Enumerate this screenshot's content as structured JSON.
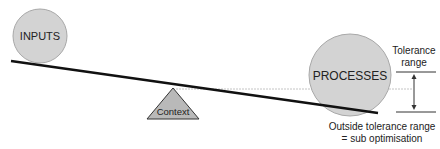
{
  "diagram": {
    "inputs_label": "INPUTS",
    "processes_label": "PROCESSES",
    "fulcrum_label": "Context",
    "tolerance_label_line1": "Tolerance",
    "tolerance_label_line2": "range",
    "outside_label_line1": "Outside tolerance range",
    "outside_label_line2": "= sub optimisation"
  },
  "colors": {
    "circle_fill": "#d3d3d3",
    "circle_stroke": "#a8a8a8",
    "triangle_fill": "#b9b9b9",
    "beam": "#111111",
    "dashed": "#bbbbbb",
    "text": "#222222"
  }
}
